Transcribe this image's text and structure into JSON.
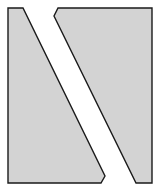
{
  "diagram": {
    "background": "#ffffff",
    "fill": "#d3d3d3",
    "stroke": "#1a1a1a",
    "stroke_width": 1.4,
    "shapes": [
      {
        "name": "left-piece",
        "points": "8,8 23,8 105,176 101,183 8,183"
      },
      {
        "name": "right-piece",
        "points": "58,8 152,8 152,183 136,183 54,16"
      }
    ]
  }
}
